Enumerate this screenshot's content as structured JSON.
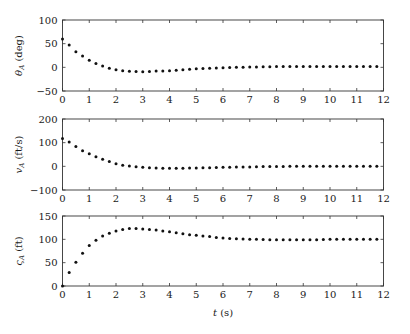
{
  "chart_data": [
    {
      "type": "scatter",
      "title": "",
      "xlabel": "",
      "ylabel": "θ_A (deg)",
      "ylabel_main": "θ",
      "ylabel_sub": "A",
      "ylabel_unit": " (deg)",
      "xlim": [
        0,
        12
      ],
      "ylim": [
        -50,
        100
      ],
      "xticks": [
        0,
        1,
        2,
        3,
        4,
        5,
        6,
        7,
        8,
        9,
        10,
        11,
        12
      ],
      "yticks": [
        -50,
        0,
        50,
        100
      ],
      "grid": false,
      "series": [
        {
          "name": "theta_A",
          "x": [
            0,
            0.25,
            0.5,
            0.75,
            1,
            1.25,
            1.5,
            1.75,
            2,
            2.25,
            2.5,
            2.75,
            3,
            3.25,
            3.5,
            3.75,
            4,
            4.25,
            4.5,
            4.75,
            5,
            5.25,
            5.5,
            5.75,
            6,
            6.25,
            6.5,
            6.75,
            7,
            7.25,
            7.5,
            7.75,
            8,
            8.25,
            8.5,
            8.75,
            9,
            9.25,
            9.5,
            9.75,
            10,
            10.25,
            10.5,
            10.75,
            11,
            11.25,
            11.5,
            11.75
          ],
          "y": [
            60,
            47,
            33,
            24,
            15,
            8,
            3,
            -2,
            -5,
            -7,
            -8.5,
            -9,
            -9.5,
            -9,
            -8,
            -7.5,
            -7,
            -6,
            -5,
            -4,
            -3,
            -2.5,
            -2,
            -1.5,
            -1,
            -0.5,
            0,
            0,
            0.5,
            0.5,
            1,
            1,
            1.5,
            1.5,
            1.5,
            1.5,
            1.5,
            1.5,
            1.5,
            1.5,
            1.5,
            1.5,
            1.5,
            1.5,
            1.5,
            1.5,
            1.5,
            1.5
          ]
        }
      ]
    },
    {
      "type": "scatter",
      "title": "",
      "xlabel": "",
      "ylabel": "v_A (ft/s)",
      "ylabel_main": "v",
      "ylabel_sub": "A",
      "ylabel_unit": " (ft/s)",
      "xlim": [
        0,
        12
      ],
      "ylim": [
        -100,
        200
      ],
      "xticks": [
        0,
        1,
        2,
        3,
        4,
        5,
        6,
        7,
        8,
        9,
        10,
        11,
        12
      ],
      "yticks": [
        -100,
        0,
        100,
        200
      ],
      "grid": false,
      "series": [
        {
          "name": "v_A",
          "x": [
            0,
            0.25,
            0.5,
            0.75,
            1,
            1.25,
            1.5,
            1.75,
            2,
            2.25,
            2.5,
            2.75,
            3,
            3.25,
            3.5,
            3.75,
            4,
            4.25,
            4.5,
            4.75,
            5,
            5.25,
            5.5,
            5.75,
            6,
            6.25,
            6.5,
            6.75,
            7,
            7.25,
            7.5,
            7.75,
            8,
            8.25,
            8.5,
            8.75,
            9,
            9.25,
            9.5,
            9.75,
            10,
            10.25,
            10.5,
            10.75,
            11,
            11.25,
            11.5,
            11.75
          ],
          "y": [
            118,
            103,
            84,
            66,
            53,
            40,
            30,
            20,
            11,
            5,
            1,
            -2,
            -4,
            -6,
            -7,
            -8,
            -8,
            -8,
            -8,
            -7,
            -7,
            -6,
            -6,
            -5,
            -4,
            -4,
            -3,
            -3,
            -3,
            -2,
            -1,
            -1,
            -1,
            -1,
            0,
            0,
            0,
            0,
            0,
            0,
            0,
            0,
            0,
            0,
            0,
            0,
            0,
            0
          ]
        }
      ]
    },
    {
      "type": "scatter",
      "title": "",
      "xlabel": "t (s)",
      "xlabel_main": "t",
      "xlabel_unit": " (s)",
      "ylabel": "ς_A (ft)",
      "ylabel_main": "ς",
      "ylabel_sub": "A",
      "ylabel_unit": " (ft)",
      "xlim": [
        0,
        12
      ],
      "ylim": [
        0,
        150
      ],
      "xticks": [
        0,
        1,
        2,
        3,
        4,
        5,
        6,
        7,
        8,
        9,
        10,
        11,
        12
      ],
      "yticks": [
        0,
        50,
        100,
        150
      ],
      "grid": false,
      "series": [
        {
          "name": "c_A",
          "x": [
            0,
            0.25,
            0.5,
            0.75,
            1,
            1.25,
            1.5,
            1.75,
            2,
            2.25,
            2.5,
            2.75,
            3,
            3.25,
            3.5,
            3.75,
            4,
            4.25,
            4.5,
            4.75,
            5,
            5.25,
            5.5,
            5.75,
            6,
            6.25,
            6.5,
            6.75,
            7,
            7.25,
            7.5,
            7.75,
            8,
            8.25,
            8.5,
            8.75,
            9,
            9.25,
            9.5,
            9.75,
            10,
            10.25,
            10.5,
            10.75,
            11,
            11.25,
            11.5,
            11.75
          ],
          "y": [
            0,
            29,
            51,
            70,
            87,
            98,
            107,
            113,
            118,
            121,
            123,
            123,
            122,
            121,
            120,
            118,
            116,
            114,
            112,
            110,
            109,
            107,
            106,
            104,
            103,
            102,
            101,
            100.5,
            100,
            100,
            99.5,
            99,
            99,
            99,
            99,
            99,
            99,
            99,
            99,
            99.5,
            100,
            100,
            100,
            100,
            100,
            100,
            100,
            100
          ]
        }
      ]
    }
  ]
}
